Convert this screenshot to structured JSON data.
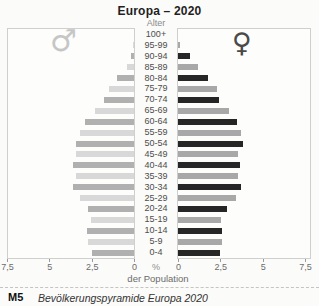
{
  "title": "Europa – 2020",
  "age_axis_label": "Alter",
  "percent_label": "%",
  "population_label": "der Population",
  "caption": {
    "tag": "M5",
    "text": "Bevölkerungspyramide Europa 2020"
  },
  "symbols": {
    "male": "♂",
    "female": "♀"
  },
  "colors": {
    "male_dark": "#b0b0b0",
    "male_light": "#d8d8d8",
    "female_dark": "#262626",
    "female_light": "#a8a8a8",
    "panel_border": "#cfcfcf"
  },
  "chart_data": {
    "type": "bar",
    "subtype": "population-pyramid",
    "title": "Europa – 2020",
    "xlabel": "% der Population",
    "ylabel": "Alter",
    "xlim": [
      0,
      7.5
    ],
    "x_ticks_left": [
      "7,5",
      "5",
      "2,5",
      "0"
    ],
    "x_ticks_right": [
      "0",
      "2,5",
      "5",
      "7,5"
    ],
    "categories": [
      "100+",
      "95-99",
      "90-94",
      "85-89",
      "80-84",
      "75-79",
      "70-74",
      "65-69",
      "60-64",
      "55-59",
      "50-54",
      "45-49",
      "40-44",
      "35-39",
      "30-34",
      "25-29",
      "20-24",
      "15-19",
      "10-14",
      "5-9",
      "0-4"
    ],
    "series": [
      {
        "name": "male",
        "symbol": "♂",
        "side": "left",
        "values": [
          0.0,
          0.05,
          0.2,
          0.4,
          1.0,
          1.5,
          1.8,
          2.3,
          2.9,
          3.2,
          3.45,
          3.4,
          3.6,
          3.4,
          3.6,
          3.2,
          2.7,
          2.55,
          2.8,
          2.7,
          2.5
        ]
      },
      {
        "name": "female",
        "symbol": "♀",
        "side": "right",
        "values": [
          0.0,
          0.1,
          0.7,
          1.2,
          1.8,
          2.3,
          2.45,
          3.0,
          3.5,
          3.7,
          3.85,
          3.55,
          3.65,
          3.55,
          3.7,
          3.4,
          2.9,
          2.55,
          2.6,
          2.6,
          2.5
        ]
      }
    ],
    "legend_position": "none",
    "grid": false
  }
}
